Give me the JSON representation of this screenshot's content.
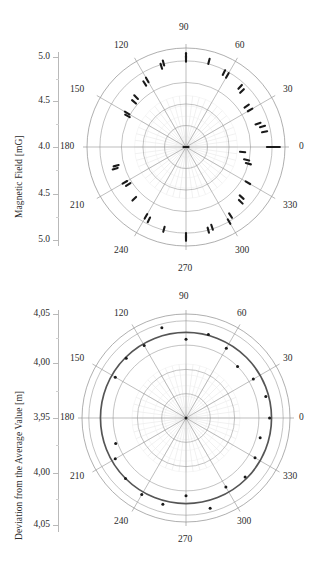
{
  "chart_data": [
    {
      "id": "magnetic-field-polar",
      "type": "scatter",
      "projection": "polar",
      "title": "",
      "ylabel": "Magnetic Field [mG]",
      "xlabel": "",
      "grid": true,
      "legend": "none",
      "radial_ticks": [
        "5.0",
        "4.5",
        "4.0",
        "4.5",
        "5.0"
      ],
      "radial_tick_values": [
        5.0,
        4.5,
        4.0,
        4.5,
        5.0
      ],
      "angular_ticks": [
        "0",
        "30",
        "60",
        "90",
        "120",
        "150",
        "180",
        "210",
        "240",
        "270",
        "300",
        "330"
      ],
      "angular_tick_values": [
        0,
        30,
        60,
        90,
        120,
        150,
        180,
        210,
        240,
        270,
        300,
        330
      ],
      "rlim": [
        4.0,
        5.15
      ],
      "rings": [
        4.25,
        4.5,
        4.75,
        5.0
      ],
      "marker": "short-dash-cluster",
      "marker_color": "#1a1a1a",
      "grid_color": "#9a9a9a",
      "points": [
        {
          "theta": 0,
          "r": 4.97
        },
        {
          "theta": 0,
          "r": 5.02
        },
        {
          "theta": 0,
          "r": 5.06
        },
        {
          "theta": 11,
          "r": 4.93
        },
        {
          "theta": 15,
          "r": 4.92
        },
        {
          "theta": 18,
          "r": 4.88
        },
        {
          "theta": 30,
          "r": 4.86
        },
        {
          "theta": 34,
          "r": 4.85
        },
        {
          "theta": 45,
          "r": 4.92
        },
        {
          "theta": 48,
          "r": 4.94
        },
        {
          "theta": 60,
          "r": 4.96
        },
        {
          "theta": 63,
          "r": 4.97
        },
        {
          "theta": 75,
          "r": 5.03
        },
        {
          "theta": 90,
          "r": 5.06
        },
        {
          "theta": 90,
          "r": 5.02
        },
        {
          "theta": 105,
          "r": 5.01
        },
        {
          "theta": 107,
          "r": 4.98
        },
        {
          "theta": 120,
          "r": 4.9
        },
        {
          "theta": 123,
          "r": 4.88
        },
        {
          "theta": 135,
          "r": 4.82
        },
        {
          "theta": 139,
          "r": 4.8
        },
        {
          "theta": 150,
          "r": 4.79
        },
        {
          "theta": 152,
          "r": 4.77
        },
        {
          "theta": 180,
          "r": 4.0
        },
        {
          "theta": 195,
          "r": 4.84
        },
        {
          "theta": 197,
          "r": 4.86
        },
        {
          "theta": 210,
          "r": 4.82
        },
        {
          "theta": 213,
          "r": 4.8
        },
        {
          "theta": 225,
          "r": 4.85
        },
        {
          "theta": 240,
          "r": 4.93
        },
        {
          "theta": 243,
          "r": 4.95
        },
        {
          "theta": 255,
          "r": 4.99
        },
        {
          "theta": 270,
          "r": 5.06
        },
        {
          "theta": 270,
          "r": 5.03
        },
        {
          "theta": 285,
          "r": 5.0
        },
        {
          "theta": 288,
          "r": 4.98
        },
        {
          "theta": 300,
          "r": 5.0
        },
        {
          "theta": 303,
          "r": 4.95
        },
        {
          "theta": 315,
          "r": 4.9
        },
        {
          "theta": 318,
          "r": 4.87
        },
        {
          "theta": 330,
          "r": 4.83
        },
        {
          "theta": 345,
          "r": 4.75
        },
        {
          "theta": 348,
          "r": 4.72
        },
        {
          "theta": 355,
          "r": 4.66
        }
      ]
    },
    {
      "id": "deviation-polar",
      "type": "scatter",
      "projection": "polar",
      "title": "",
      "ylabel": "Deviation from the Average Value [m]",
      "xlabel": "",
      "grid": true,
      "legend": "none",
      "radial_ticks": [
        "4,05",
        "4,00",
        "3,95",
        "4,00",
        "4,05"
      ],
      "radial_tick_values": [
        4.05,
        4.0,
        3.95,
        4.0,
        4.05
      ],
      "angular_ticks": [
        "0",
        "30",
        "60",
        "90",
        "120",
        "150",
        "180",
        "210",
        "240",
        "270",
        "300",
        "330"
      ],
      "angular_tick_values": [
        0,
        30,
        60,
        90,
        120,
        150,
        180,
        210,
        240,
        270,
        300,
        330
      ],
      "rlim": [
        3.95,
        4.057
      ],
      "rings": [
        3.975,
        4.0,
        4.025,
        4.05
      ],
      "reference_circle": 4.038,
      "reference_circle_color": "#555555",
      "marker": "dot",
      "marker_color": "#1a1a1a",
      "grid_color": "#9a9a9a",
      "points": [
        {
          "theta": 0,
          "r": 4.036
        },
        {
          "theta": 15,
          "r": 4.035
        },
        {
          "theta": 30,
          "r": 4.03
        },
        {
          "theta": 45,
          "r": 4.025
        },
        {
          "theta": 60,
          "r": 4.033
        },
        {
          "theta": 75,
          "r": 4.039
        },
        {
          "theta": 90,
          "r": 4.031
        },
        {
          "theta": 105,
          "r": 4.046
        },
        {
          "theta": 120,
          "r": 4.036
        },
        {
          "theta": 135,
          "r": 4.037
        },
        {
          "theta": 150,
          "r": 4.034
        },
        {
          "theta": 180,
          "r": 3.95
        },
        {
          "theta": 200,
          "r": 4.027
        },
        {
          "theta": 210,
          "r": 4.034
        },
        {
          "theta": 225,
          "r": 4.038
        },
        {
          "theta": 240,
          "r": 4.041
        },
        {
          "theta": 255,
          "r": 4.042
        },
        {
          "theta": 270,
          "r": 4.03
        },
        {
          "theta": 285,
          "r": 4.046
        },
        {
          "theta": 300,
          "r": 4.032
        },
        {
          "theta": 315,
          "r": 4.036
        },
        {
          "theta": 330,
          "r": 4.032
        },
        {
          "theta": 345,
          "r": 4.029
        }
      ]
    }
  ],
  "panels": {
    "top": {
      "ylabel": "Magnetic Field [mG]",
      "radial_ticks": [
        "5.0",
        "4.5",
        "4.0",
        "4.5",
        "5.0"
      ],
      "angle_labels": [
        "0",
        "30",
        "60",
        "90",
        "120",
        "150",
        "180",
        "210",
        "240",
        "270",
        "300",
        "330"
      ]
    },
    "bottom": {
      "ylabel": "Deviation from the Average Value [m]",
      "radial_ticks": [
        "4,05",
        "4,00",
        "3,95",
        "4,00",
        "4,05"
      ],
      "angle_labels": [
        "0",
        "30",
        "60",
        "90",
        "120",
        "150",
        "180",
        "210",
        "240",
        "270",
        "300",
        "330"
      ]
    }
  }
}
